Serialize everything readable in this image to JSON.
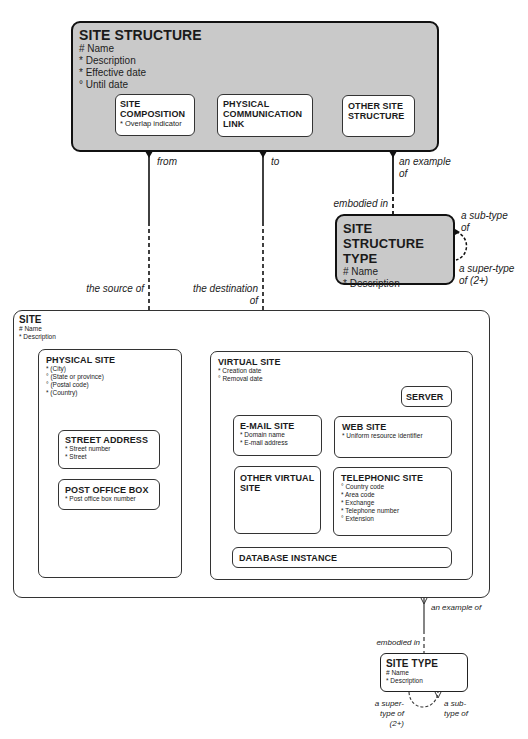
{
  "site_structure": {
    "title": "SITE STRUCTURE",
    "attributes": [
      "# Name",
      "* Description",
      "* Effective date",
      "° Until date"
    ],
    "subtypes": [
      {
        "title": "SITE COMPOSITION",
        "attributes": [
          "* Overlap indicator"
        ]
      },
      {
        "title": "PHYSICAL COMMUNICATION LINK",
        "attributes": []
      },
      {
        "title": "OTHER SITE STRUCTURE",
        "attributes": []
      }
    ]
  },
  "site_structure_type": {
    "title": "SITE STRUCTURE TYPE",
    "attributes": [
      "# Name",
      "* Description"
    ]
  },
  "site": {
    "title": "SITE",
    "attributes": [
      "# Name",
      "* Description"
    ],
    "physical_site": {
      "title": "PHYSICAL SITE",
      "attributes": [
        "* (City)",
        "° (State or province)",
        "° (Postal code)",
        "* (Country)"
      ],
      "street_address": {
        "title": "STREET ADDRESS",
        "attributes": [
          "* Street number",
          "* Street"
        ]
      },
      "post_office_box": {
        "title": "POST OFFICE BOX",
        "attributes": [
          "* Post office box number"
        ]
      }
    },
    "virtual_site": {
      "title": "VIRTUAL SITE",
      "attributes": [
        "* Creation date",
        "° Removal date"
      ],
      "server": {
        "title": "SERVER"
      },
      "email_site": {
        "title": "E-MAIL SITE",
        "attributes": [
          "* Domain name",
          "* E-mail address"
        ]
      },
      "web_site": {
        "title": "WEB SITE",
        "attributes": [
          "* Uniform resource identifier"
        ]
      },
      "other_virtual_site": {
        "title": "OTHER VIRTUAL SITE"
      },
      "telephonic_site": {
        "title": "TELEPHONIC SITE",
        "attributes": [
          "° Country code",
          "* Area code",
          "* Exchange",
          "* Telephone number",
          "° Extension"
        ]
      },
      "database_instance": {
        "title": "DATABASE INSTANCE"
      }
    }
  },
  "site_type": {
    "title": "SITE TYPE",
    "attributes": [
      "# Name",
      "* Description"
    ]
  },
  "relationships": {
    "from": "from",
    "to": "to",
    "an_example_of_top": "an example of",
    "embodied_in_top": "embodied in",
    "sst_subtype_of": "a sub-type of",
    "sst_supertype_of": "a super-type of (2+)",
    "the_source_of": "the source of",
    "the_destination_of": "the destination of",
    "an_example_of_bottom": "an example of",
    "embodied_in_bottom": "embodied in",
    "st_supertype_of": "a super-type of (2+)",
    "st_subtype_of": "a sub-type of"
  },
  "colors": {
    "shaded_fill": "#c9c9c9",
    "line": "#111111"
  }
}
